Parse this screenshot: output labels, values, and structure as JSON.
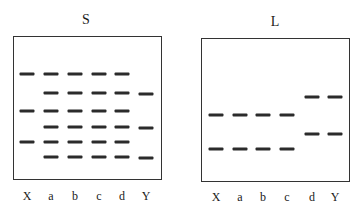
{
  "gels": [
    {
      "id": "S",
      "title": "S",
      "title_pos": {
        "x": 86,
        "y": 12
      },
      "box": {
        "left": 13,
        "top": 36,
        "right": 162,
        "bottom": 180
      },
      "lanes": [
        {
          "label": "X",
          "x": 27,
          "bands_y": [
            74,
            111,
            142
          ]
        },
        {
          "label": "a",
          "x": 51,
          "bands_y": [
            74,
            93,
            111,
            127,
            142,
            157
          ]
        },
        {
          "label": "b",
          "x": 75,
          "bands_y": [
            74,
            93,
            111,
            127,
            142,
            157
          ]
        },
        {
          "label": "c",
          "x": 99,
          "bands_y": [
            74,
            93,
            111,
            127,
            142,
            157
          ]
        },
        {
          "label": "d",
          "x": 122,
          "bands_y": [
            74,
            93,
            111,
            127,
            142,
            157
          ]
        },
        {
          "label": "Y",
          "x": 146,
          "bands_y": [
            94,
            128,
            158
          ]
        }
      ],
      "label_y": 196
    },
    {
      "id": "L",
      "title": "L",
      "title_pos": {
        "x": 275,
        "y": 14
      },
      "box": {
        "left": 201,
        "top": 38,
        "right": 350,
        "bottom": 182
      },
      "lanes": [
        {
          "label": "X",
          "x": 216,
          "bands_y": [
            115,
            149
          ]
        },
        {
          "label": "a",
          "x": 240,
          "bands_y": [
            115,
            149
          ]
        },
        {
          "label": "b",
          "x": 263,
          "bands_y": [
            115,
            149
          ]
        },
        {
          "label": "c",
          "x": 287,
          "bands_y": [
            115,
            149
          ]
        },
        {
          "label": "d",
          "x": 312,
          "bands_y": [
            97,
            134
          ]
        },
        {
          "label": "Y",
          "x": 335,
          "bands_y": [
            97,
            134
          ]
        }
      ],
      "label_y": 197
    }
  ],
  "colors": {
    "band": "#2b2b2b",
    "border": "#333333",
    "background": "#ffffff"
  }
}
